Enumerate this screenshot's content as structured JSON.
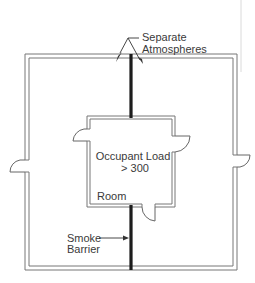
{
  "diagram": {
    "labels": {
      "separate_atmospheres_line1": "Separate",
      "separate_atmospheres_line2": "Atmospheres",
      "occupant_load_line1": "Occupant Load",
      "occupant_load_line2": "> 300",
      "room": "Room",
      "smoke_barrier_line1": "Smoke",
      "smoke_barrier_line2": "Barrier"
    },
    "elements": {
      "outer_building": "building-outline",
      "room": "room-outline",
      "smoke_barrier": "smoke-barrier-wall",
      "doors": [
        "outer-left-door",
        "outer-right-door",
        "room-left-door",
        "room-right-door",
        "room-bottom-door"
      ]
    },
    "colors": {
      "wall": "#777777",
      "barrier": "#1c1c1c",
      "text": "#3a3a3a"
    }
  }
}
